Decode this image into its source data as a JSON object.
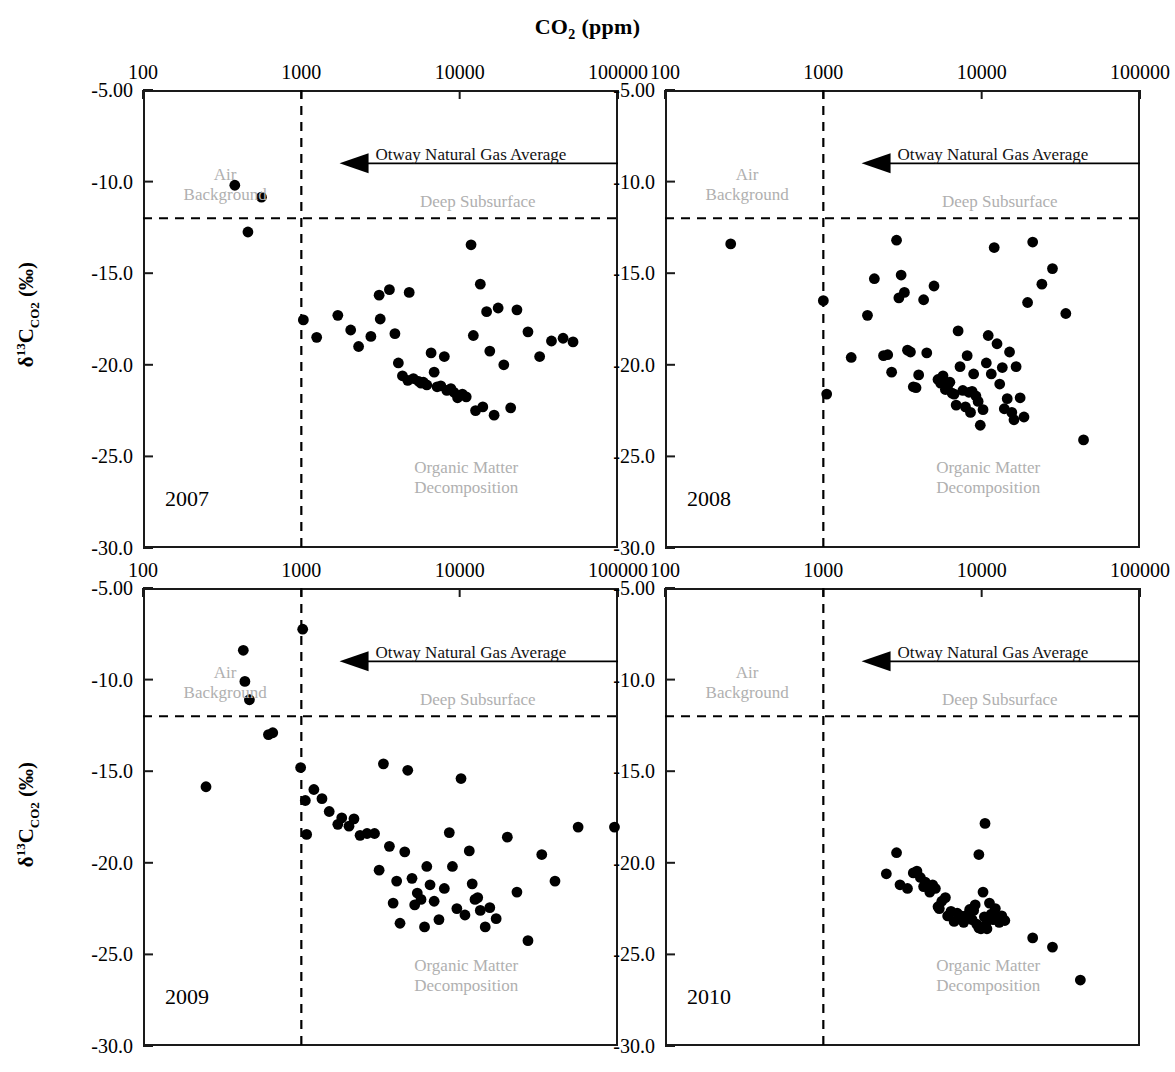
{
  "figure": {
    "title_main": "CO",
    "title_sub": "2",
    "title_tail": " (ppm)",
    "title_full": "CO2 (ppm)",
    "ylabel_delta": "δ",
    "ylabel_sup": "13",
    "ylabel_c": "C",
    "ylabel_sub": "CO2",
    "ylabel_units": " (‰)",
    "background_color": "#ffffff",
    "axis_color": "#1a1a1a",
    "point_color": "#000000",
    "annotation_color": "#b0b0b0"
  },
  "axes": {
    "x_type": "log",
    "x_ticks": [
      "100",
      "1000",
      "10000",
      "100000"
    ],
    "x_tick_values": [
      100,
      1000,
      10000,
      100000
    ],
    "xlim": [
      100,
      100000
    ],
    "y_ticks": [
      "-5.00",
      "-10.0",
      "-15.0",
      "-20.0",
      "-25.0",
      "-30.0"
    ],
    "y_tick_values": [
      -5,
      -10,
      -15,
      -20,
      -25,
      -30
    ],
    "ylim": [
      -30,
      -5
    ],
    "vline_value": 1000,
    "hline_value": -12.0,
    "otway_arrow_value": -9.0
  },
  "annotations": {
    "air_background": "Air\nBackground",
    "air_background_line1": "Air",
    "air_background_line2": "Background",
    "otway": "Otway Natural Gas Average",
    "deep_subsurface": "Deep Subsurface",
    "organic_line1": "Organic Matter",
    "organic_line2": "Decomposition"
  },
  "chart_data": {
    "type": "scatter",
    "title": "CO2 (ppm)",
    "xlabel": "CO2 (ppm)",
    "ylabel": "δ13C_CO2 (‰)",
    "xscale": "log",
    "xlim": [
      100,
      100000
    ],
    "ylim": [
      -30,
      -5
    ],
    "grid": false,
    "legend": "none",
    "reference_lines": [
      {
        "name": "co2-1000-vline",
        "orientation": "vertical",
        "value": 1000,
        "style": "dashed"
      },
      {
        "name": "deep-subsurface-hline",
        "orientation": "horizontal",
        "value": -12.0,
        "style": "dashed"
      },
      {
        "name": "otway-natural-gas-average",
        "orientation": "horizontal",
        "value": -9.0,
        "style": "solid-arrow-left",
        "label": "Otway Natural Gas Average"
      }
    ],
    "panels": [
      {
        "name": "2007",
        "label": "2007",
        "otway_line_from_x": 2400,
        "points": [
          [
            380,
            -10.2
          ],
          [
            560,
            -10.85
          ],
          [
            460,
            -12.75
          ],
          [
            1030,
            -17.55
          ],
          [
            1250,
            -18.5
          ],
          [
            1700,
            -17.3
          ],
          [
            2050,
            -18.1
          ],
          [
            2300,
            -19.0
          ],
          [
            2750,
            -18.45
          ],
          [
            3100,
            -16.2
          ],
          [
            3150,
            -17.5
          ],
          [
            3600,
            -15.9
          ],
          [
            3900,
            -18.3
          ],
          [
            4100,
            -19.9
          ],
          [
            4350,
            -20.6
          ],
          [
            4700,
            -20.85
          ],
          [
            4800,
            -16.05
          ],
          [
            5100,
            -20.75
          ],
          [
            5500,
            -20.9
          ],
          [
            5700,
            -21.0
          ],
          [
            5900,
            -20.95
          ],
          [
            6200,
            -21.1
          ],
          [
            6600,
            -19.35
          ],
          [
            6900,
            -20.4
          ],
          [
            7200,
            -21.2
          ],
          [
            7600,
            -21.15
          ],
          [
            8000,
            -19.55
          ],
          [
            8300,
            -21.4
          ],
          [
            8800,
            -21.3
          ],
          [
            9200,
            -21.5
          ],
          [
            9700,
            -21.8
          ],
          [
            10400,
            -21.6
          ],
          [
            11000,
            -21.75
          ],
          [
            11800,
            -13.45
          ],
          [
            12200,
            -18.4
          ],
          [
            12600,
            -22.5
          ],
          [
            13500,
            -15.6
          ],
          [
            14000,
            -22.3
          ],
          [
            14800,
            -17.1
          ],
          [
            15500,
            -19.25
          ],
          [
            16500,
            -22.75
          ],
          [
            17500,
            -16.9
          ],
          [
            19000,
            -20.0
          ],
          [
            21000,
            -22.35
          ],
          [
            23000,
            -17.0
          ],
          [
            27000,
            -18.2
          ],
          [
            32000,
            -19.55
          ],
          [
            38000,
            -18.7
          ],
          [
            45000,
            -18.55
          ],
          [
            52000,
            -18.75
          ]
        ]
      },
      {
        "name": "2008",
        "label": "2008",
        "otway_line_from_x": 2400,
        "points": [
          [
            260,
            -13.4
          ],
          [
            1000,
            -16.5
          ],
          [
            1050,
            -21.6
          ],
          [
            1500,
            -19.6
          ],
          [
            1900,
            -17.3
          ],
          [
            2100,
            -15.3
          ],
          [
            2400,
            -19.5
          ],
          [
            2550,
            -19.45
          ],
          [
            2700,
            -20.4
          ],
          [
            2900,
            -13.2
          ],
          [
            3000,
            -16.35
          ],
          [
            3100,
            -15.1
          ],
          [
            3250,
            -16.05
          ],
          [
            3400,
            -19.2
          ],
          [
            3550,
            -19.3
          ],
          [
            3700,
            -21.2
          ],
          [
            3850,
            -21.25
          ],
          [
            4000,
            -20.55
          ],
          [
            4300,
            -16.45
          ],
          [
            4500,
            -19.35
          ],
          [
            5000,
            -15.7
          ],
          [
            5300,
            -20.8
          ],
          [
            5500,
            -21.0
          ],
          [
            5700,
            -20.6
          ],
          [
            5900,
            -21.35
          ],
          [
            6100,
            -21.15
          ],
          [
            6300,
            -20.95
          ],
          [
            6500,
            -21.55
          ],
          [
            6700,
            -21.6
          ],
          [
            6900,
            -22.2
          ],
          [
            7100,
            -18.15
          ],
          [
            7300,
            -20.1
          ],
          [
            7600,
            -21.4
          ],
          [
            7900,
            -22.3
          ],
          [
            8100,
            -19.5
          ],
          [
            8300,
            -21.5
          ],
          [
            8500,
            -22.6
          ],
          [
            8700,
            -21.45
          ],
          [
            8900,
            -20.5
          ],
          [
            9200,
            -21.7
          ],
          [
            9500,
            -22.0
          ],
          [
            9800,
            -23.3
          ],
          [
            10200,
            -22.45
          ],
          [
            10700,
            -19.9
          ],
          [
            11000,
            -18.4
          ],
          [
            11500,
            -20.5
          ],
          [
            12000,
            -13.6
          ],
          [
            12500,
            -18.85
          ],
          [
            13000,
            -21.05
          ],
          [
            13500,
            -20.15
          ],
          [
            13900,
            -22.4
          ],
          [
            14500,
            -21.85
          ],
          [
            15000,
            -19.3
          ],
          [
            15500,
            -22.6
          ],
          [
            16000,
            -23.0
          ],
          [
            16500,
            -20.1
          ],
          [
            17500,
            -21.8
          ],
          [
            18500,
            -22.85
          ],
          [
            19500,
            -16.6
          ],
          [
            21000,
            -13.3
          ],
          [
            24000,
            -15.6
          ],
          [
            28000,
            -14.75
          ],
          [
            34000,
            -17.2
          ],
          [
            44000,
            -24.1
          ]
        ]
      },
      {
        "name": "2009",
        "label": "2009",
        "otway_line_from_x": 2400,
        "points": [
          [
            250,
            -15.85
          ],
          [
            430,
            -8.4
          ],
          [
            440,
            -10.1
          ],
          [
            470,
            -11.1
          ],
          [
            620,
            -13.0
          ],
          [
            660,
            -12.9
          ],
          [
            990,
            -14.8
          ],
          [
            1020,
            -7.25
          ],
          [
            1060,
            -16.6
          ],
          [
            1080,
            -18.45
          ],
          [
            1200,
            -16.0
          ],
          [
            1350,
            -16.5
          ],
          [
            1500,
            -17.2
          ],
          [
            1700,
            -17.9
          ],
          [
            1800,
            -17.55
          ],
          [
            2000,
            -18.0
          ],
          [
            2150,
            -17.6
          ],
          [
            2350,
            -18.5
          ],
          [
            2600,
            -18.4
          ],
          [
            2900,
            -18.4
          ],
          [
            3100,
            -20.4
          ],
          [
            3300,
            -14.6
          ],
          [
            3600,
            -19.1
          ],
          [
            3800,
            -22.2
          ],
          [
            4000,
            -21.0
          ],
          [
            4200,
            -23.3
          ],
          [
            4500,
            -19.4
          ],
          [
            4700,
            -14.95
          ],
          [
            5000,
            -20.85
          ],
          [
            5200,
            -22.3
          ],
          [
            5400,
            -21.65
          ],
          [
            5700,
            -22.0
          ],
          [
            6000,
            -23.5
          ],
          [
            6200,
            -20.2
          ],
          [
            6500,
            -21.2
          ],
          [
            6900,
            -22.1
          ],
          [
            7400,
            -23.1
          ],
          [
            8000,
            -21.4
          ],
          [
            8600,
            -18.35
          ],
          [
            9000,
            -20.2
          ],
          [
            9600,
            -22.5
          ],
          [
            10200,
            -15.4
          ],
          [
            10800,
            -22.85
          ],
          [
            11500,
            -19.35
          ],
          [
            12000,
            -21.15
          ],
          [
            12500,
            -22.0
          ],
          [
            13000,
            -21.9
          ],
          [
            13500,
            -22.6
          ],
          [
            14500,
            -23.5
          ],
          [
            15500,
            -22.45
          ],
          [
            17000,
            -23.05
          ],
          [
            20000,
            -18.6
          ],
          [
            23000,
            -21.6
          ],
          [
            27000,
            -24.25
          ],
          [
            33000,
            -19.55
          ],
          [
            40000,
            -21.0
          ],
          [
            56000,
            -18.05
          ],
          [
            95000,
            -18.05
          ]
        ]
      },
      {
        "name": "2010",
        "label": "2010",
        "otway_line_from_x": 2400,
        "points": [
          [
            2500,
            -20.6
          ],
          [
            2900,
            -19.45
          ],
          [
            3050,
            -21.2
          ],
          [
            3400,
            -21.4
          ],
          [
            3700,
            -20.55
          ],
          [
            3900,
            -20.45
          ],
          [
            4100,
            -20.8
          ],
          [
            4300,
            -21.3
          ],
          [
            4400,
            -21.05
          ],
          [
            4700,
            -21.6
          ],
          [
            4900,
            -21.2
          ],
          [
            5100,
            -21.4
          ],
          [
            5300,
            -22.4
          ],
          [
            5400,
            -22.5
          ],
          [
            5600,
            -22.1
          ],
          [
            5900,
            -21.9
          ],
          [
            6100,
            -22.9
          ],
          [
            6400,
            -22.65
          ],
          [
            6700,
            -23.2
          ],
          [
            7000,
            -22.75
          ],
          [
            7400,
            -22.9
          ],
          [
            7700,
            -23.25
          ],
          [
            8100,
            -22.85
          ],
          [
            8400,
            -22.55
          ],
          [
            8700,
            -23.1
          ],
          [
            8900,
            -22.6
          ],
          [
            9100,
            -22.3
          ],
          [
            9300,
            -23.35
          ],
          [
            9600,
            -23.55
          ],
          [
            9900,
            -23.6
          ],
          [
            10200,
            -21.6
          ],
          [
            10400,
            -22.95
          ],
          [
            10600,
            -23.4
          ],
          [
            10800,
            -23.6
          ],
          [
            11200,
            -22.2
          ],
          [
            11500,
            -22.8
          ],
          [
            11800,
            -23.1
          ],
          [
            12200,
            -22.5
          ],
          [
            12500,
            -23.0
          ],
          [
            12900,
            -23.25
          ],
          [
            9600,
            -19.55
          ],
          [
            10500,
            -17.85
          ],
          [
            13400,
            -22.9
          ],
          [
            14000,
            -23.15
          ],
          [
            21000,
            -24.1
          ],
          [
            28000,
            -24.6
          ],
          [
            42000,
            -26.4
          ]
        ]
      }
    ]
  },
  "panel_labels": [
    "2007",
    "2008",
    "2009",
    "2010"
  ]
}
